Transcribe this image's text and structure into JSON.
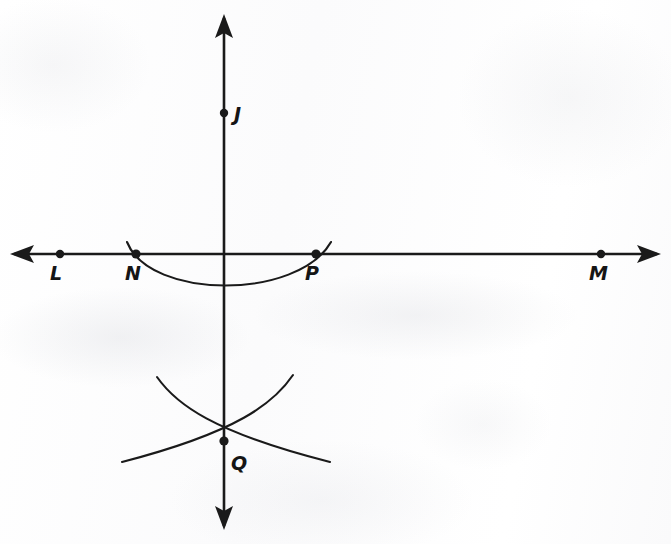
{
  "figure": {
    "kind": "geometry-construction-diagram",
    "stroke_color": "#1a1a1a",
    "background_color": "#fdfdfd",
    "canvas": {
      "width": 671,
      "height": 544
    },
    "lines": [
      {
        "name": "horizontal-line-LM",
        "orientation": "horizontal",
        "y": 254,
        "x_start": 10,
        "x_end": 661,
        "arrow_start": true,
        "arrow_end": true
      },
      {
        "name": "vertical-line-JQ",
        "orientation": "vertical",
        "x": 224,
        "y_start": 14,
        "y_end": 530,
        "arrow_start": true,
        "arrow_end": true
      }
    ],
    "points": [
      {
        "id": "J",
        "label": "J",
        "x": 224,
        "y": 113,
        "label_x": 234,
        "label_y": 103
      },
      {
        "id": "L",
        "label": "L",
        "x": 60,
        "y": 254,
        "label_x": 50,
        "label_y": 262
      },
      {
        "id": "N",
        "label": "N",
        "x": 136,
        "y": 254,
        "label_x": 125,
        "label_y": 262
      },
      {
        "id": "P",
        "label": "P",
        "x": 316,
        "y": 254,
        "label_x": 305,
        "label_y": 262
      },
      {
        "id": "M",
        "label": "M",
        "x": 601,
        "y": 254,
        "label_x": 589,
        "label_y": 262
      },
      {
        "id": "Q",
        "label": "Q",
        "x": 224,
        "y": 441,
        "label_x": 231,
        "label_y": 452
      }
    ],
    "arcs": [
      {
        "name": "arc-through-N-and-P",
        "path": "M 127,242 Q 224,327 331,242",
        "note": "arc centered on vertical line crossing horizontal line at N and P"
      },
      {
        "name": "arc-from-upper-left",
        "path": "M 157,377 Q 196,417 330,462",
        "note": "compass arc descending left to right through Q"
      },
      {
        "name": "arc-from-upper-right",
        "path": "M 293,375 Q 254,415 122,462",
        "note": "compass arc descending right to left through Q"
      }
    ]
  }
}
